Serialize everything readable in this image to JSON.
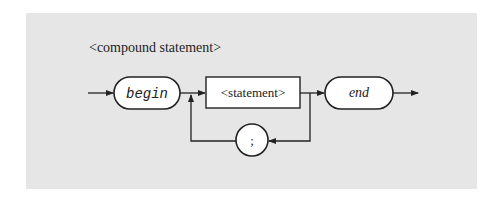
{
  "diagram": {
    "title": "<compound statement>",
    "nodes": {
      "begin": {
        "label": "begin",
        "shape": "rounded-terminal"
      },
      "statement": {
        "label": "<statement>",
        "shape": "rectangle-nonterminal"
      },
      "end": {
        "label": "end",
        "shape": "rounded-terminal"
      },
      "separator": {
        "label": ";",
        "shape": "circle-terminal"
      }
    },
    "edges": [
      {
        "from": "entry",
        "to": "begin"
      },
      {
        "from": "begin",
        "to": "statement"
      },
      {
        "from": "statement",
        "to": "end"
      },
      {
        "from": "statement",
        "to": "separator",
        "note": "loop back"
      },
      {
        "from": "separator",
        "to": "statement"
      },
      {
        "from": "end",
        "to": "exit"
      }
    ],
    "colors": {
      "panel": "#e6e6e6",
      "node_fill": "#ffffff",
      "stroke": "#222222"
    }
  }
}
